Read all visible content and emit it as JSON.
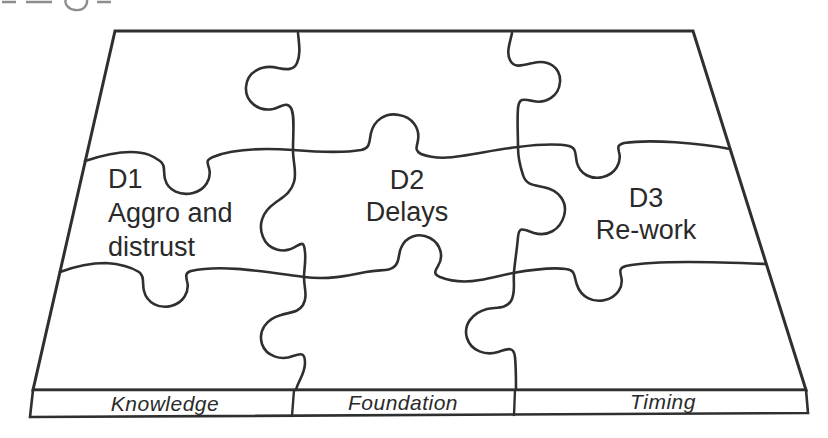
{
  "figure": {
    "pieces": [
      {
        "id": "D1",
        "lines": [
          "Aggro and",
          "distrust"
        ]
      },
      {
        "id": "D2",
        "lines": [
          "Delays"
        ]
      },
      {
        "id": "D3",
        "lines": [
          "Re-work"
        ]
      }
    ],
    "base": {
      "segments": [
        "Knowledge",
        "Foundation",
        "Timing"
      ]
    },
    "colors": {
      "line": "#2f2f2f",
      "text": "#2a2a2a",
      "fragment": "#8d8d8d",
      "background": "#ffffff"
    }
  }
}
